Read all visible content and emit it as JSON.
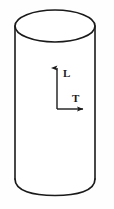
{
  "figure": {
    "name": "cylinder-orientation-diagram",
    "background_color": "#fefefe",
    "stroke_color": "#1a1a1a",
    "fill_color": "#ffffff"
  },
  "cylinder": {
    "name": "cylinder-shape",
    "left_x": 15,
    "right_x": 95,
    "top_ellipse_center_y": 26,
    "top_ellipse_rx": 40,
    "top_ellipse_ry": 16,
    "body_top_y": 26,
    "body_bottom_y": 179,
    "bottom_arc_depth_y": 195,
    "stroke_width": 1.6
  },
  "axes": {
    "name": "orientation-axes",
    "origin_x": 57,
    "origin_y": 109,
    "vertical_tip_y": 68,
    "horizontal_tip_x": 83,
    "stroke_width": 1.4,
    "labels": [
      {
        "id": "axis-label-l",
        "text": "L",
        "meaning": "longitudinal",
        "x": 63,
        "y": 77,
        "direction": "up"
      },
      {
        "id": "axis-label-t",
        "text": "T",
        "meaning": "transverse",
        "x": 72,
        "y": 102,
        "direction": "right"
      }
    ]
  }
}
